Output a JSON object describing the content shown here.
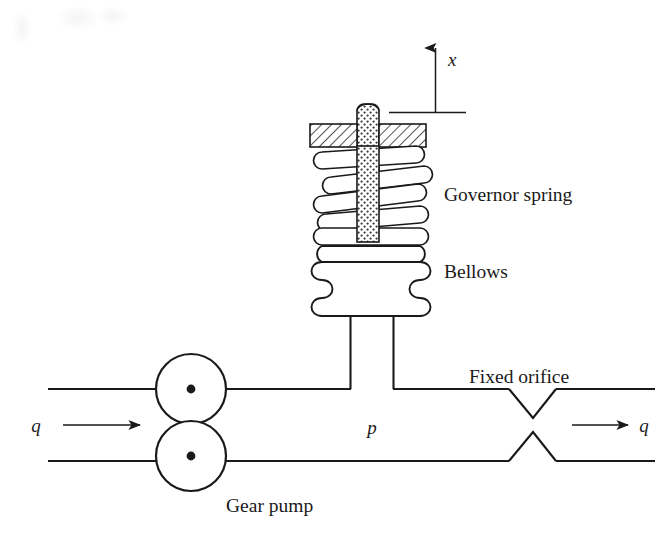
{
  "figure": {
    "background_color": "#ffffff",
    "ink_color": "#1a1a1a",
    "width": 663,
    "height": 547
  },
  "labels": {
    "governor_spring": "Governor spring",
    "bellows": "Bellows",
    "fixed_orifice": "Fixed orifice",
    "gear_pump": "Gear pump",
    "displacement_x": "x",
    "pressure_p": "p",
    "flow_in_q": "q",
    "flow_out_q": "q"
  },
  "components": {
    "displacement_axis": {
      "name": "x",
      "arrow_direction": "up",
      "datum_line": true
    },
    "spring": {
      "name": "Governor spring",
      "turns": 4,
      "style": "helical-outline"
    },
    "rod": {
      "name": "stem",
      "fill_pattern": "stippled"
    },
    "mounting_plate": {
      "name": "fixed support",
      "fill_pattern": "diagonal-hatch",
      "segments": 2
    },
    "bellows": {
      "name": "Bellows",
      "convolutions": 3,
      "style": "corrugated"
    },
    "gear_pump": {
      "name": "Gear pump",
      "gears": 2,
      "shaft_marker": "center-dot"
    },
    "orifice": {
      "name": "Fixed orifice",
      "style": "v-notch-constriction"
    },
    "pipe": {
      "name": "fluid line",
      "flow_in": "q",
      "flow_out": "q",
      "pressure_tap": "p"
    }
  }
}
